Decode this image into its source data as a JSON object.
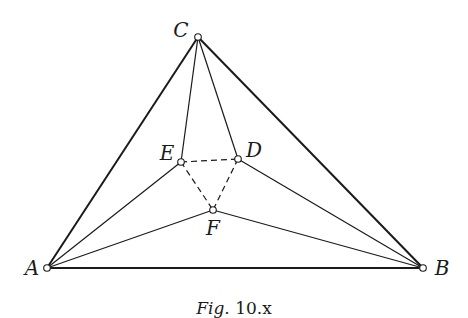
{
  "figure": {
    "caption": {
      "prefix": "Fig.",
      "number": "10.x"
    },
    "points": {
      "A": {
        "label": "A",
        "x": 47,
        "y": 268,
        "label_x": 32,
        "label_y": 268
      },
      "B": {
        "label": "B",
        "x": 423,
        "y": 268,
        "label_x": 442,
        "label_y": 268
      },
      "C": {
        "label": "C",
        "x": 198,
        "y": 37,
        "label_x": 181,
        "label_y": 30
      },
      "D": {
        "label": "D",
        "x": 238,
        "y": 159,
        "label_x": 254,
        "label_y": 150
      },
      "E": {
        "label": "E",
        "x": 181,
        "y": 162,
        "label_x": 167,
        "label_y": 153
      },
      "F": {
        "label": "F",
        "x": 213,
        "y": 210,
        "label_x": 213,
        "label_y": 228
      }
    },
    "segments": {
      "outer_triangle": [
        [
          "A",
          "B"
        ],
        [
          "B",
          "C"
        ],
        [
          "C",
          "A"
        ]
      ],
      "inner_solid": [
        [
          "A",
          "E"
        ],
        [
          "A",
          "F"
        ],
        [
          "B",
          "D"
        ],
        [
          "B",
          "F"
        ],
        [
          "C",
          "E"
        ],
        [
          "C",
          "D"
        ]
      ],
      "dashed": [
        [
          "E",
          "D"
        ],
        [
          "E",
          "F"
        ],
        [
          "D",
          "F"
        ]
      ]
    },
    "colors": {
      "stroke": "#1a1a1a",
      "point_fill": "#ffffff",
      "background": "#ffffff"
    }
  }
}
